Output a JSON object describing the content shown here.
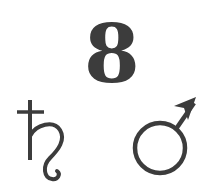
{
  "symbols": {
    "top": {
      "label": "8",
      "meaning": "digit-eight"
    },
    "bottom_left": {
      "glyph": "♄",
      "meaning": "saturn-symbol"
    },
    "bottom_right": {
      "glyph": "♂",
      "meaning": "mars-symbol"
    }
  },
  "colors": {
    "ink": "#3c3c3c",
    "background": "#ffffff"
  }
}
